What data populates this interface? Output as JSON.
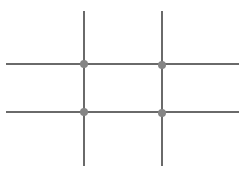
{
  "diagram": {
    "type": "rule-of-thirds-grid",
    "canvas": {
      "width": 247,
      "height": 174,
      "background": "#ffffff"
    },
    "colors": {
      "line": "#6a6a6a",
      "node": "#858585"
    },
    "line_width": 2,
    "vertical_lines": [
      {
        "x": 84,
        "y1": 11,
        "y2": 166
      },
      {
        "x": 162,
        "y1": 11,
        "y2": 166
      }
    ],
    "horizontal_lines": [
      {
        "y": 64,
        "x1": 6,
        "x2": 239
      },
      {
        "y": 112,
        "x1": 6,
        "x2": 239
      }
    ],
    "nodes": [
      {
        "cx": 84,
        "cy": 64,
        "r": 4
      },
      {
        "cx": 162,
        "cy": 65,
        "r": 4
      },
      {
        "cx": 84,
        "cy": 112,
        "r": 4
      },
      {
        "cx": 162,
        "cy": 113,
        "r": 4
      }
    ]
  }
}
